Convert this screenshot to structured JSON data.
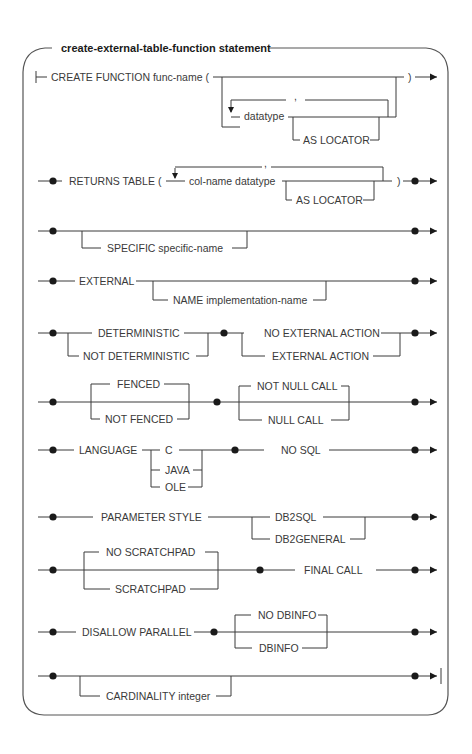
{
  "title": "create-external-table-function statement",
  "rows": {
    "create": {
      "keyword": "CREATE FUNCTION func-name  (",
      "close": ")",
      "repeat_sep": ",",
      "param": "datatype",
      "optional": "AS LOCATOR"
    },
    "returns": {
      "keyword": "RETURNS TABLE (",
      "repeat_sep": ",",
      "param": "col-name  datatype",
      "optional": "AS LOCATOR",
      "close": ")"
    },
    "specific": {
      "optional": "SPECIFIC  specific-name"
    },
    "external": {
      "keyword": "EXTERNAL",
      "optional": "NAME  implementation-name"
    },
    "deterministic": {
      "choices_a": [
        "DETERMINISTIC",
        "NOT DETERMINISTIC"
      ],
      "choices_b": [
        "NO EXTERNAL ACTION",
        "EXTERNAL ACTION"
      ]
    },
    "fenced": {
      "choices_a": [
        "FENCED",
        "NOT FENCED"
      ],
      "choices_b": [
        "NOT NULL CALL",
        "NULL CALL"
      ]
    },
    "language": {
      "keyword": "LANGUAGE",
      "choices": [
        "C",
        "JAVA",
        "OLE"
      ],
      "keyword2": "NO SQL"
    },
    "parameter": {
      "keyword": "PARAMETER  STYLE",
      "choices": [
        "DB2SQL",
        "DB2GENERAL"
      ]
    },
    "scratchpad": {
      "choices": [
        "NO  SCRATCHPAD",
        "SCRATCHPAD"
      ],
      "keyword2": "FINAL  CALL"
    },
    "parallel": {
      "keyword": "DISALLOW PARALLEL",
      "choices": [
        "NO DBINFO",
        "DBINFO"
      ]
    },
    "cardinality": {
      "optional": "CARDINALITY integer"
    }
  }
}
